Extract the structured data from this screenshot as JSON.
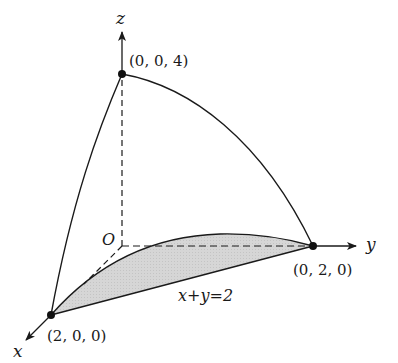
{
  "figure": {
    "type": "3d-region-diagram",
    "axes": {
      "x_label": "x",
      "y_label": "y",
      "z_label": "z",
      "origin_label": "O"
    },
    "points": [
      {
        "id": "p_z",
        "label": "(0, 0, 4)"
      },
      {
        "id": "p_y",
        "label": "(0, 2, 0)"
      },
      {
        "id": "p_x",
        "label": "(2, 0, 0)"
      }
    ],
    "boundary_label": "x+y=2",
    "colors": {
      "stroke": "#1a1a1a",
      "shade": "#d4d4d4",
      "background": "#ffffff"
    }
  }
}
